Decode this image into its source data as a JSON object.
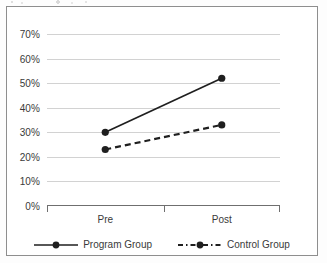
{
  "chart_data": {
    "type": "line",
    "title": "",
    "xlabel": "",
    "ylabel": "",
    "categories": [
      "Pre",
      "Post"
    ],
    "series": [
      {
        "name": "Program Group",
        "values": [
          30,
          52
        ],
        "style": "solid",
        "marker": "filled-circle",
        "color": "#1f1f1f"
      },
      {
        "name": "Control Group",
        "values": [
          23,
          33
        ],
        "style": "dashed",
        "marker": "filled-circle",
        "color": "#1f1f1f"
      }
    ],
    "ylim": [
      0,
      70
    ],
    "ytick_step": 10,
    "ytick_labels": [
      "0%",
      "10%",
      "20%",
      "30%",
      "40%",
      "50%",
      "60%",
      "70%"
    ],
    "grid": true,
    "grid_axis": "y",
    "legend_position": "bottom"
  },
  "axis": {
    "y_ticks": [
      {
        "label": "70%",
        "value": 70
      },
      {
        "label": "60%",
        "value": 60
      },
      {
        "label": "50%",
        "value": 50
      },
      {
        "label": "40%",
        "value": 40
      },
      {
        "label": "30%",
        "value": 30
      },
      {
        "label": "20%",
        "value": 20
      },
      {
        "label": "10%",
        "value": 10
      },
      {
        "label": "0%",
        "value": 0
      }
    ],
    "x_ticks": [
      {
        "label": "Pre"
      },
      {
        "label": "Post"
      }
    ]
  },
  "legend": {
    "items": [
      {
        "label": "Program Group",
        "style": "solid"
      },
      {
        "label": "Control Group",
        "style": "dashed"
      }
    ]
  },
  "colors": {
    "line": "#1f1f1f",
    "grid": "#d2d2d2",
    "axis": "#6f6f6f",
    "frame": "#8e8e8e",
    "text": "#3a3a3a",
    "background": "#ffffff"
  }
}
